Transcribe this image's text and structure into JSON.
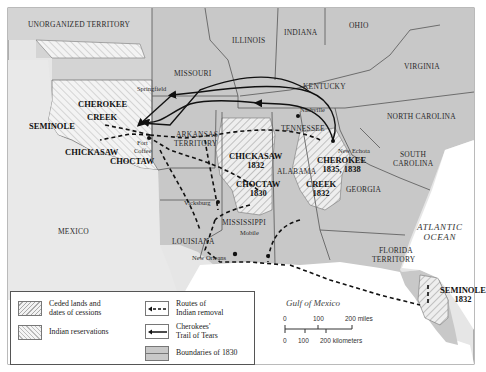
{
  "map": {
    "regions": {
      "unorganized_territory": "UNORGANIZED TERRITORY",
      "missouri": "MISSOURI",
      "illinois": "ILLINOIS",
      "indiana": "INDIANA",
      "ohio": "OHIO",
      "kentucky": "KENTUCKY",
      "virginia": "VIRGINIA",
      "north_carolina": "NORTH CAROLINA",
      "tennessee": "TENNESSEE",
      "arkansas_territory_1": "ARKANSAS",
      "arkansas_territory_2": "TERRITORY",
      "south_carolina_1": "SOUTH",
      "south_carolina_2": "CAROLINA",
      "georgia": "GEORGIA",
      "alabama": "ALABAMA",
      "mississippi": "MISSISSIPPI",
      "louisiana": "LOUISIANA",
      "mexico": "MEXICO",
      "florida_territory_1": "FLORIDA",
      "florida_territory_2": "TERRITORY"
    },
    "cities": {
      "springfield": "Springfield",
      "nashville": "Nashville",
      "new_echota": "New Echota",
      "fort_coffee_1": "Fort",
      "fort_coffee_2": "Coffee",
      "vicksburg": "Vicksburg",
      "mobile": "Mobile",
      "new_orleans": "New Orleans"
    },
    "tribes": {
      "cherokee_west": "CHEROKEE",
      "creek_west": "CREEK",
      "seminole_west": "SEMINOLE",
      "chickasaw_west": "CHICKASAW",
      "choctaw_west": "CHOCTAW",
      "chickasaw_east": "CHICKASAW",
      "chickasaw_east_year": "1832",
      "choctaw_east": "CHOCTAW",
      "choctaw_east_year": "1830",
      "cherokee_east": "CHEROKEE",
      "cherokee_east_year": "1835, 1838",
      "creek_east": "CREEK",
      "creek_east_year": "1832",
      "seminole_east": "SEMINOLE",
      "seminole_east_year": "1832"
    },
    "water": {
      "atlantic_1": "ATLANTIC",
      "atlantic_2": "OCEAN",
      "gulf": "Gulf of Mexico"
    },
    "legend": {
      "ceded_1": "Ceded lands and",
      "ceded_2": "dates of cessions",
      "reservations": "Indian reservations",
      "routes_1": "Routes of",
      "routes_2": "Indian removal",
      "trail_1": "Cherokees'",
      "trail_2": "Trail of Tears",
      "boundaries": "Boundaries of 1830"
    },
    "scale": {
      "miles_0": "0",
      "miles_100": "100",
      "miles_200": "200 miles",
      "km_0": "0",
      "km_100": "100",
      "km_200": "200 kilometers"
    },
    "colors": {
      "land_us": "#c9c9c9",
      "land_foreign": "#e9e9e9",
      "water": "#ffffff",
      "boundary": "#555555",
      "route": "#111111"
    }
  }
}
